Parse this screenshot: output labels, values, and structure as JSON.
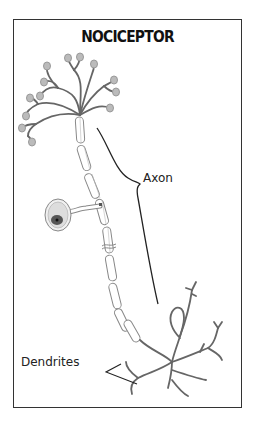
{
  "diagram": {
    "title": "NOCICEPTOR",
    "labels": {
      "axon": "Axon",
      "dendrites": "Dendrites"
    },
    "colors": {
      "frame": "#333333",
      "nerve": "#666666",
      "myelin": "#888888",
      "terminal": "#999999",
      "nucleus": "#444444",
      "bracket": "#222222"
    },
    "parts": [
      "free nerve endings",
      "myelinated axon",
      "cell body",
      "axon bracket",
      "dendrites"
    ]
  }
}
